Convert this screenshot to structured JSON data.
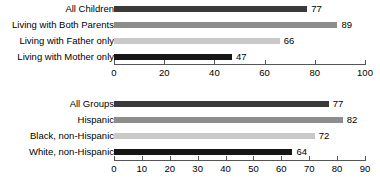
{
  "chart_data": [
    {
      "id": "top",
      "type": "bar",
      "orientation": "horizontal",
      "title": "",
      "xlabel": "",
      "ylabel": "",
      "xlim": [
        0,
        100
      ],
      "xticks": [
        0,
        20,
        40,
        60,
        80,
        100
      ],
      "grid": false,
      "legend": "none",
      "categories": [
        "All Children",
        "Living with Both Parents",
        "Living with Father only",
        "Living with Mother only"
      ],
      "values": [
        77,
        89,
        66,
        47
      ],
      "value_labels": [
        "77",
        "89",
        "66",
        "47"
      ],
      "bar_colors": [
        "#3a3a3a",
        "#8d8d8d",
        "#c9c9c9",
        "#161616"
      ]
    },
    {
      "id": "bottom",
      "type": "bar",
      "orientation": "horizontal",
      "title": "",
      "xlabel": "",
      "ylabel": "",
      "xlim": [
        0,
        90
      ],
      "xticks": [
        0,
        10,
        20,
        30,
        40,
        50,
        60,
        70,
        80,
        90
      ],
      "grid": false,
      "legend": "none",
      "categories": [
        "All Groups",
        "Hispanic",
        "Black, non-Hispanic",
        "White, non-Hispanic"
      ],
      "values": [
        77,
        82,
        72,
        64
      ],
      "value_labels": [
        "77",
        "82",
        "72",
        "64"
      ],
      "bar_colors": [
        "#3a3a3a",
        "#8d8d8d",
        "#c9c9c9",
        "#161616"
      ]
    }
  ],
  "axis_color": "#555555"
}
